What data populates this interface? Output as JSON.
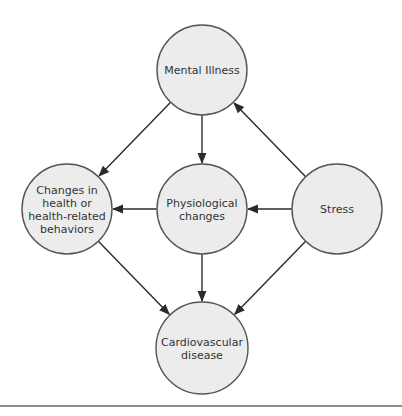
{
  "diagram": {
    "type": "causal-flow",
    "nodes": [
      {
        "id": "mental",
        "lines": [
          "Mental Illness"
        ],
        "cx": 202,
        "cy": 70,
        "r": 45
      },
      {
        "id": "changes",
        "lines": [
          "Changes in",
          "health or",
          "health-related",
          "behaviors"
        ],
        "cx": 67,
        "cy": 209,
        "r": 45
      },
      {
        "id": "physio",
        "lines": [
          "Physiological",
          "changes"
        ],
        "cx": 202,
        "cy": 209,
        "r": 45
      },
      {
        "id": "stress",
        "lines": [
          "Stress"
        ],
        "cx": 337,
        "cy": 209,
        "r": 45
      },
      {
        "id": "cardio",
        "lines": [
          "Cardiovascular",
          "disease"
        ],
        "cx": 202,
        "cy": 348,
        "r": 46
      }
    ],
    "edges": [
      {
        "from": "mental",
        "to": "changes"
      },
      {
        "from": "mental",
        "to": "physio"
      },
      {
        "from": "stress",
        "to": "mental"
      },
      {
        "from": "physio",
        "to": "changes"
      },
      {
        "from": "stress",
        "to": "physio"
      },
      {
        "from": "changes",
        "to": "cardio"
      },
      {
        "from": "physio",
        "to": "cardio"
      },
      {
        "from": "stress",
        "to": "cardio"
      }
    ],
    "colors": {
      "node_fill": "#ececec",
      "node_stroke": "#555555",
      "edge": "#2b2b2b",
      "text": "#333333",
      "rule": "#8c8c8c"
    }
  }
}
